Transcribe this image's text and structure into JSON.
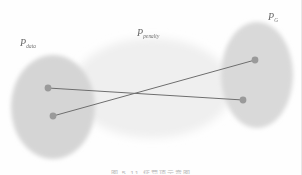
{
  "figure": {
    "title_caption": "图 5-11  惩罚项示意图",
    "background_color": "#fefefe",
    "labels": {
      "p_data": {
        "symbol": "P",
        "subscript": "data"
      },
      "p_penalty": {
        "symbol": "P",
        "subscript": "penalty"
      },
      "p_g": {
        "symbol": "P",
        "subscript": "G"
      }
    },
    "regions": [
      {
        "name": "p-data-region",
        "label": "P_data",
        "shape": "ellipse",
        "cx": 53,
        "cy": 107,
        "rx": 42,
        "ry": 52,
        "fill": "#d5d5d5",
        "opacity": 0.95
      },
      {
        "name": "p-penalty-region",
        "label": "P_penalty",
        "shape": "ellipse",
        "cx": 152,
        "cy": 88,
        "rx": 80,
        "ry": 50,
        "fill": "#efefef",
        "opacity": 0.95
      },
      {
        "name": "p-g-region",
        "label": "P_G",
        "shape": "ellipse",
        "cx": 257,
        "cy": 75,
        "rx": 36,
        "ry": 53,
        "fill": "#d9d9d9",
        "opacity": 0.95
      }
    ],
    "points": [
      {
        "name": "p-data-sample-1",
        "x": 48,
        "y": 88,
        "r": 3.4,
        "fill": "#9a9a9a",
        "region": "P_data"
      },
      {
        "name": "p-data-sample-2",
        "x": 53,
        "y": 116,
        "r": 3.4,
        "fill": "#9a9a9a",
        "region": "P_data"
      },
      {
        "name": "p-g-sample-1",
        "x": 255,
        "y": 60,
        "r": 3.4,
        "fill": "#9a9a9a",
        "region": "P_G"
      },
      {
        "name": "p-g-sample-2",
        "x": 243,
        "y": 100,
        "r": 3.4,
        "fill": "#9a9a9a",
        "region": "P_G"
      }
    ],
    "connectors": [
      {
        "name": "connector-data1-to-g2",
        "x1": 48,
        "y1": 88,
        "x2": 243,
        "y2": 100,
        "stroke": "#6e6e6e",
        "width": 1.0
      },
      {
        "name": "connector-data2-to-g1",
        "x1": 53,
        "y1": 116,
        "x2": 255,
        "y2": 60,
        "stroke": "#6e6e6e",
        "width": 1.0
      }
    ]
  }
}
